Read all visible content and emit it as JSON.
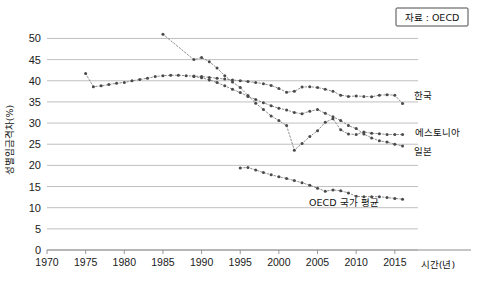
{
  "chart_data": {
    "type": "line",
    "title": "",
    "xlabel": "시간(년)",
    "ylabel": "성별임금격차(%)",
    "xlim": [
      1970,
      2018
    ],
    "ylim": [
      0,
      52
    ],
    "xticks": [
      1970,
      1975,
      1980,
      1985,
      1990,
      1995,
      2000,
      2005,
      2010,
      2015
    ],
    "yticks": [
      0,
      5,
      10,
      15,
      20,
      25,
      30,
      35,
      40,
      45,
      50
    ],
    "grid": true,
    "legend_position": "inline-right-labels",
    "source_note": "자료 : OECD",
    "marker": "dot",
    "linestyle": "dotted",
    "series": [
      {
        "name": "한국",
        "x": [
          1975,
          1976,
          1977,
          1978,
          1979,
          1980,
          1981,
          1982,
          1983,
          1984,
          1985,
          1986,
          1987,
          1988,
          1989,
          1990,
          1991,
          1992,
          1993,
          1994,
          1995,
          1996,
          1997,
          1998,
          1999,
          2000,
          2001,
          2002,
          2003,
          2004,
          2005,
          2006,
          2007,
          2008,
          2009,
          2010,
          2011,
          2012,
          2013,
          2014,
          2015,
          2016
        ],
        "y": [
          41.7,
          38.6,
          38.8,
          39.1,
          39.4,
          39.6,
          40.0,
          40.3,
          40.6,
          41.0,
          41.2,
          41.3,
          41.3,
          41.2,
          41.1,
          41.0,
          40.8,
          40.6,
          40.4,
          40.2,
          40.0,
          39.8,
          39.6,
          39.3,
          38.9,
          38.2,
          37.3,
          37.5,
          38.5,
          38.6,
          38.4,
          38.0,
          37.5,
          36.6,
          36.3,
          36.4,
          36.3,
          36.2,
          36.6,
          36.7,
          36.6,
          34.6
        ]
      },
      {
        "name": "에스토니아",
        "x": [
          1985,
          1989,
          1990,
          1991,
          1992,
          1993,
          1994,
          1995,
          1996,
          1997,
          1998,
          1999,
          2000,
          2001,
          2002,
          2003,
          2004,
          2005,
          2006,
          2007,
          2008,
          2009,
          2010,
          2011,
          2012,
          2013,
          2014,
          2015,
          2016
        ],
        "y": [
          51.0,
          45.0,
          45.5,
          44.5,
          43.0,
          41.2,
          39.7,
          38.4,
          36.5,
          34.7,
          33.2,
          31.7,
          30.6,
          29.4,
          23.6,
          25.2,
          26.8,
          28.2,
          30.2,
          31.0,
          28.4,
          27.4,
          27.3,
          27.9,
          27.6,
          27.5,
          27.3,
          27.3,
          27.3
        ]
      },
      {
        "name": "일본",
        "x": [
          1989,
          1990,
          1991,
          1992,
          1993,
          1994,
          1995,
          1996,
          1997,
          1998,
          1999,
          2000,
          2001,
          2002,
          2003,
          2004,
          2005,
          2006,
          2007,
          2008,
          2009,
          2010,
          2011,
          2012,
          2013,
          2014,
          2015,
          2016
        ],
        "y": [
          41.0,
          40.7,
          40.2,
          39.6,
          38.8,
          38.0,
          37.2,
          36.3,
          35.6,
          34.8,
          34.1,
          33.5,
          33.1,
          32.5,
          32.2,
          32.8,
          33.2,
          32.3,
          31.5,
          30.6,
          29.4,
          28.7,
          27.4,
          26.5,
          25.8,
          25.5,
          25.0,
          24.6
        ]
      },
      {
        "name": "OECD 국가 평균",
        "x": [
          1995,
          1996,
          1997,
          1998,
          1999,
          2000,
          2001,
          2002,
          2003,
          2004,
          2005,
          2006,
          2007,
          2008,
          2009,
          2010,
          2011,
          2012,
          2013,
          2014,
          2015,
          2016
        ],
        "y": [
          19.4,
          19.5,
          18.9,
          18.3,
          17.8,
          17.3,
          16.9,
          16.4,
          15.9,
          15.3,
          14.6,
          13.9,
          14.2,
          14.0,
          13.5,
          12.7,
          12.6,
          12.6,
          12.6,
          12.4,
          12.2,
          12.0
        ]
      }
    ],
    "series_label_anchors": [
      {
        "name": "한국",
        "x": 2017.2,
        "y": 36.4
      },
      {
        "name": "에스토니아",
        "x": 2017.4,
        "y": 27.7
      },
      {
        "name": "일본",
        "x": 2017.2,
        "y": 23.2
      },
      {
        "name": "OECD 국가 평균",
        "x": 2008.4,
        "y": 11.0
      }
    ]
  }
}
